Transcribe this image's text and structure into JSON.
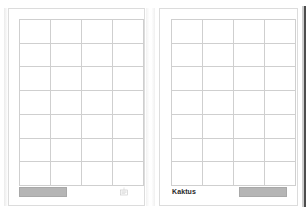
{
  "document": {
    "type": "two-page-form-spread",
    "background_color": "#fdfdfd",
    "page_color": "#ffffff",
    "rule_color": "#cfcfcf",
    "fill_color": "#b5b5b5",
    "edge_color": "#2e2e2e"
  },
  "pages": [
    {
      "id": "left-page",
      "grid": {
        "columns": 4,
        "rows": 7
      },
      "footer": {
        "fill_block_label": "",
        "fill_block_position": "left",
        "title": "",
        "corner_mark": "stamp-mark"
      }
    },
    {
      "id": "right-page",
      "grid": {
        "columns": 4,
        "rows": 7
      },
      "footer": {
        "fill_block_label": "",
        "fill_block_position": "right",
        "title": "Kaktus",
        "corner_mark": ""
      }
    }
  ]
}
